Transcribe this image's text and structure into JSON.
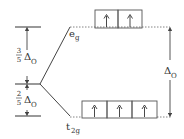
{
  "diagram": {
    "levels": {
      "upper": {
        "label_main": "e",
        "label_sub": "g",
        "electrons": [
          "up",
          "up"
        ],
        "box_count": 2
      },
      "lower": {
        "label_main": "t",
        "label_sub": "2g",
        "electrons": [
          "up",
          "up",
          "up"
        ],
        "box_count": 3
      }
    },
    "left_gaps": {
      "upper": {
        "numerator": "3",
        "denominator": "5",
        "symbol": "Δ",
        "sub": "O"
      },
      "lower": {
        "numerator": "2",
        "denominator": "5",
        "symbol": "Δ",
        "sub": "O"
      }
    },
    "right_gap": {
      "symbol": "Δ",
      "sub": "O"
    },
    "colors": {
      "line": "#444444",
      "text": "#333333",
      "box": "#555555"
    }
  }
}
